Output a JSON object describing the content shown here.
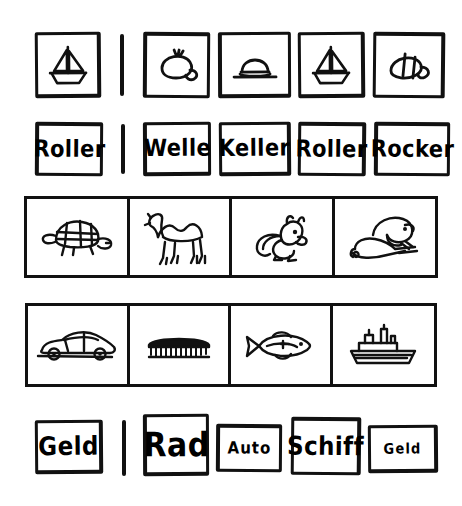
{
  "worksheet": {
    "title": "Picture and word matching worksheet",
    "ink_color": "#111111",
    "paper_color": "#ffffff",
    "rows": [
      {
        "id": "row-1",
        "type": "picture",
        "prompt": {
          "icon": "sailboat-icon",
          "label": "sailboat"
        },
        "divider": true,
        "options": [
          {
            "icon": "beret-cap-icon",
            "label": "beret"
          },
          {
            "icon": "brimmed-hat-icon",
            "label": "hat"
          },
          {
            "icon": "sailboat-icon",
            "label": "sailboat"
          },
          {
            "icon": "segmented-cap-icon",
            "label": "cap"
          }
        ]
      },
      {
        "id": "row-2",
        "type": "word",
        "prompt": {
          "text": "Roller",
          "size": "md"
        },
        "divider": true,
        "options": [
          {
            "text": "Welle",
            "size": "md"
          },
          {
            "text": "Keller",
            "size": "md"
          },
          {
            "text": "Roller",
            "size": "md"
          },
          {
            "text": "Rocker",
            "size": "md"
          }
        ]
      },
      {
        "id": "row-3",
        "type": "picture-strip",
        "options": [
          {
            "icon": "tortoise-icon",
            "label": "tortoise"
          },
          {
            "icon": "camel-icon",
            "label": "camel"
          },
          {
            "icon": "squirrel-icon",
            "label": "squirrel"
          },
          {
            "icon": "beaver-on-log-icon",
            "label": "beaver"
          }
        ]
      },
      {
        "id": "row-4",
        "type": "picture-strip",
        "options": [
          {
            "icon": "car-icon",
            "label": "car"
          },
          {
            "icon": "brush-icon",
            "label": "brush"
          },
          {
            "icon": "fish-icon",
            "label": "fish"
          },
          {
            "icon": "ship-icon",
            "label": "ship"
          }
        ]
      },
      {
        "id": "row-5",
        "type": "word",
        "prompt": {
          "text": "Geld",
          "size": "lg"
        },
        "divider": true,
        "options": [
          {
            "text": "Rad",
            "size": "xl"
          },
          {
            "text": "Auto",
            "size": "sm"
          },
          {
            "text": "Schiff",
            "size": "lg"
          },
          {
            "text": "Geld",
            "size": "xs"
          }
        ]
      }
    ]
  }
}
